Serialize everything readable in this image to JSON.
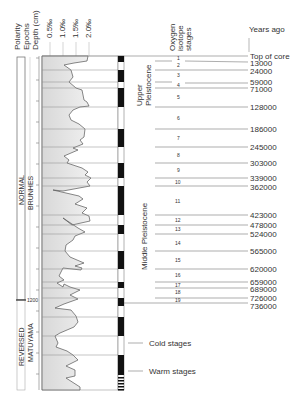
{
  "headers": {
    "polarity": "Polarity",
    "epochs": "Epochs",
    "depth": "Depth (cm)",
    "scale": [
      "0.5‰",
      "1.0‰",
      "1.5‰",
      "2.0‰"
    ],
    "oxygen": [
      "Oxygen",
      "isotope",
      "stages"
    ],
    "years_ago": "Years ago"
  },
  "polarity": {
    "normal": "NORMAL",
    "reversed": "REVERSED"
  },
  "epochs": {
    "brunhes": "BRUNHES",
    "matuyama": "MATUYAMA"
  },
  "depth_marker": "1200",
  "periods": {
    "upper": [
      "Upper",
      "Pleistocene"
    ],
    "middle": "Middle Pleistocene"
  },
  "ages": [
    "Top of core",
    "13000",
    "24000",
    "59000",
    "71000",
    "128000",
    "186000",
    "245000",
    "303000",
    "339000",
    "362000",
    "423000",
    "478000",
    "524000",
    "565000",
    "620000",
    "659000",
    "689000",
    "726000",
    "736000"
  ],
  "stages": [
    "1",
    "2",
    "3",
    "4",
    "5",
    "6",
    "7",
    "8",
    "9",
    "10",
    "11",
    "12",
    "13",
    "14",
    "15",
    "16",
    "17",
    "18",
    "19"
  ],
  "legend": {
    "cold": "Cold stages",
    "warm": "Warm stages"
  },
  "colors": {
    "fill": "#e4e4e4",
    "line": "#555555",
    "black": "#111111"
  }
}
